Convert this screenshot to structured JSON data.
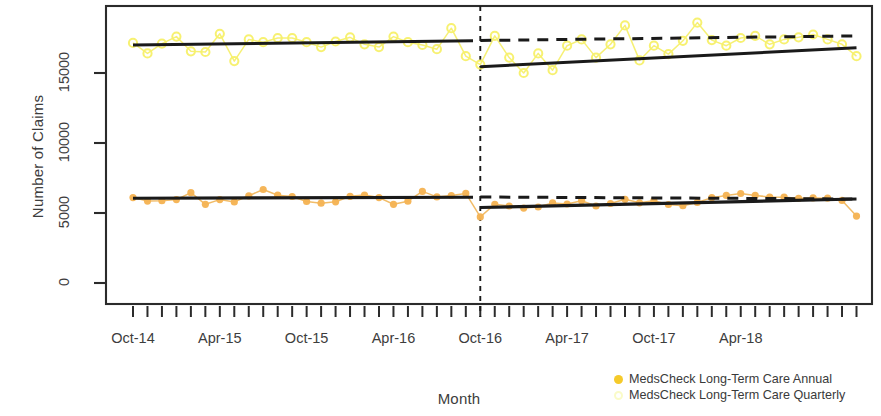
{
  "chart_data": {
    "type": "line",
    "title": "",
    "xlabel": "Month",
    "ylabel": "Number of Claims",
    "ylim": [
      0,
      19500
    ],
    "yticks": [
      0,
      5000,
      10000,
      15000
    ],
    "ytick_labels": [
      "0",
      "5000",
      "10000",
      "15000"
    ],
    "xtick_labels": [
      "Oct-14",
      "Apr-15",
      "Oct-15",
      "Apr-16",
      "Oct-16",
      "Apr-17",
      "Oct-17",
      "Apr-18"
    ],
    "xtick_months": [
      0,
      6,
      12,
      18,
      24,
      30,
      36,
      42
    ],
    "x_minor_ticks": "monthly",
    "grid": false,
    "legend_position": "bottom-right",
    "intervention": {
      "label": "Oct-16",
      "month_index": 24,
      "line_style": "dashed",
      "color": "#1a1a1a"
    },
    "x_months": [
      0,
      1,
      2,
      3,
      4,
      5,
      6,
      7,
      8,
      9,
      10,
      11,
      12,
      13,
      14,
      15,
      16,
      17,
      18,
      19,
      20,
      21,
      22,
      23,
      24,
      25,
      26,
      27,
      28,
      29,
      30,
      31,
      32,
      33,
      34,
      35,
      36,
      37,
      38,
      39,
      40,
      41,
      42,
      43,
      44,
      45,
      46,
      47,
      48,
      49,
      50
    ],
    "series": [
      {
        "name": "MedsCheck Long-Term Care Annual",
        "marker": "filled-circle",
        "color": "#f5b455",
        "line_color": "#f0b860",
        "values": [
          6100,
          5850,
          5880,
          5960,
          6450,
          5620,
          5960,
          5790,
          6230,
          6680,
          6270,
          6180,
          5820,
          5700,
          5800,
          6190,
          6280,
          6100,
          5620,
          5840,
          6540,
          6150,
          6250,
          6400,
          4720,
          5620,
          5500,
          5350,
          5430,
          5720,
          5640,
          5880,
          5500,
          5680,
          5980,
          5730,
          5880,
          5610,
          5520,
          5760,
          6090,
          6260,
          6390,
          6260,
          6140,
          6130,
          6050,
          6080,
          6060,
          5900,
          4780
        ]
      },
      {
        "name": "MedsCheck Long-Term Care Quarterly",
        "marker": "open-circle",
        "color": "#f7f069",
        "line_color": "#f6ef6e",
        "values": [
          17150,
          16400,
          17100,
          17600,
          16550,
          16500,
          17800,
          15850,
          17400,
          17200,
          17500,
          17500,
          17200,
          16850,
          17250,
          17550,
          17050,
          16850,
          17600,
          17200,
          17000,
          16700,
          18200,
          16200,
          15600,
          17650,
          16100,
          15000,
          16400,
          15200,
          16950,
          17400,
          16100,
          17050,
          18400,
          15900,
          16950,
          16350,
          17300,
          18600,
          17350,
          16950,
          17500,
          17650,
          17050,
          17400,
          17550,
          17750,
          17400,
          17050,
          16200
        ]
      }
    ],
    "fitted_lines": [
      {
        "series": "MedsCheck Long-Term Care Quarterly",
        "segment": "pre-intervention",
        "style": "solid",
        "color": "#1a1a1a",
        "x0_month": 0,
        "y0": 17000,
        "x1_month": 23.5,
        "y1": 17300
      },
      {
        "series": "MedsCheck Long-Term Care Quarterly",
        "segment": "post-intervention",
        "style": "solid",
        "color": "#1a1a1a",
        "x0_month": 24,
        "y0": 15450,
        "x1_month": 50,
        "y1": 16800
      },
      {
        "series": "MedsCheck Long-Term Care Quarterly",
        "segment": "counterfactual",
        "style": "dashed",
        "color": "#1a1a1a",
        "x0_month": 24,
        "y0": 17320,
        "x1_month": 50,
        "y1": 17650
      },
      {
        "series": "MedsCheck Long-Term Care Annual",
        "segment": "pre-intervention",
        "style": "solid",
        "color": "#1a1a1a",
        "x0_month": 0,
        "y0": 6060,
        "x1_month": 23.5,
        "y1": 6130
      },
      {
        "series": "MedsCheck Long-Term Care Annual",
        "segment": "post-intervention",
        "style": "solid",
        "color": "#1a1a1a",
        "x0_month": 24,
        "y0": 5390,
        "x1_month": 50,
        "y1": 6000
      },
      {
        "series": "MedsCheck Long-Term Care Annual",
        "segment": "counterfactual",
        "style": "dashed",
        "color": "#1a1a1a",
        "x0_month": 24,
        "y0": 6140,
        "x1_month": 50,
        "y1": 6000
      }
    ]
  },
  "legend": {
    "items": [
      {
        "label": "MedsCheck Long-Term Care Annual",
        "color": "#f5ca2a",
        "style": "filled"
      },
      {
        "label": "MedsCheck Long-Term Care Quarterly",
        "color": "#fafbc8",
        "style": "hollow"
      }
    ]
  }
}
